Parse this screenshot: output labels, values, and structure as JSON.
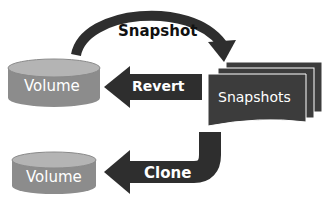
{
  "diagram": {
    "nodes": {
      "volume_top": {
        "label": "Volume",
        "shape": "cylinder"
      },
      "snapshots": {
        "label": "Snapshots",
        "shape": "stacked-pages"
      },
      "volume_bottom": {
        "label": "Volume",
        "shape": "cylinder"
      }
    },
    "edges": {
      "snapshot": {
        "label": "Snapshot",
        "from": "volume_top",
        "to": "snapshots"
      },
      "revert": {
        "label": "Revert",
        "from": "snapshots",
        "to": "volume_top"
      },
      "clone": {
        "label": "Clone",
        "from": "snapshots",
        "to": "volume_bottom"
      }
    }
  },
  "colors": {
    "cylinder_body": "#8c8c8c",
    "cylinder_top": "#b4b4b4",
    "arrow": "#2e2e2e",
    "snapshot_page": "#3c3c3c"
  }
}
